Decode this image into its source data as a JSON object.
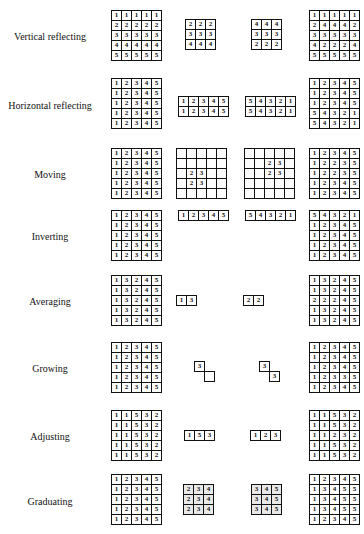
{
  "rows": [
    {
      "label": "Vertical reflecting",
      "top": 10,
      "label_top": 21,
      "grids": [
        {
          "left": 111,
          "top": 0,
          "cols": 5,
          "cells": [
            [
              1,
              1,
              1,
              1,
              1
            ],
            [
              2,
              2,
              2,
              2,
              2
            ],
            [
              3,
              3,
              3,
              3,
              3
            ],
            [
              4,
              4,
              4,
              4,
              4
            ],
            [
              5,
              5,
              5,
              5,
              5
            ]
          ]
        },
        {
          "left": 185,
          "top": 9,
          "cols": 3,
          "cells": [
            [
              2,
              2,
              2
            ],
            [
              3,
              3,
              3
            ],
            [
              4,
              4,
              4
            ]
          ]
        },
        {
          "left": 251,
          "top": 9,
          "cols": 3,
          "cells": [
            [
              4,
              4,
              4
            ],
            [
              3,
              3,
              3
            ],
            [
              2,
              2,
              2
            ]
          ]
        },
        {
          "left": 309,
          "top": 0,
          "cols": 5,
          "cells": [
            [
              1,
              1,
              1,
              1,
              1
            ],
            [
              2,
              4,
              4,
              4,
              2
            ],
            [
              3,
              3,
              3,
              3,
              3
            ],
            [
              4,
              2,
              2,
              2,
              4
            ],
            [
              5,
              5,
              5,
              5,
              5
            ]
          ]
        }
      ]
    },
    {
      "label": "Horizontal reflecting",
      "top": 78,
      "label_top": 22,
      "grids": [
        {
          "left": 111,
          "top": 0,
          "cols": 5,
          "cells": [
            [
              1,
              2,
              3,
              4,
              5
            ],
            [
              1,
              2,
              3,
              4,
              5
            ],
            [
              1,
              2,
              3,
              4,
              5
            ],
            [
              1,
              2,
              3,
              4,
              5
            ],
            [
              1,
              2,
              3,
              4,
              5
            ]
          ]
        },
        {
          "left": 178,
          "top": 18,
          "cols": 5,
          "cells": [
            [
              1,
              2,
              3,
              4,
              5
            ],
            [
              1,
              2,
              3,
              4,
              5
            ]
          ]
        },
        {
          "left": 245,
          "top": 18,
          "cols": 5,
          "cells": [
            [
              5,
              4,
              3,
              2,
              1
            ],
            [
              5,
              4,
              3,
              2,
              1
            ]
          ]
        },
        {
          "left": 309,
          "top": 0,
          "cols": 5,
          "cells": [
            [
              1,
              2,
              3,
              4,
              5
            ],
            [
              1,
              2,
              3,
              4,
              5
            ],
            [
              1,
              2,
              3,
              4,
              5
            ],
            [
              5,
              4,
              3,
              2,
              1
            ],
            [
              5,
              4,
              3,
              2,
              1
            ]
          ]
        }
      ]
    },
    {
      "label": "Moving",
      "top": 148,
      "label_top": 21,
      "grids": [
        {
          "left": 111,
          "top": 0,
          "cols": 5,
          "cells": [
            [
              1,
              2,
              3,
              4,
              5
            ],
            [
              1,
              2,
              3,
              4,
              5
            ],
            [
              1,
              2,
              3,
              4,
              5
            ],
            [
              1,
              2,
              3,
              4,
              5
            ],
            [
              1,
              2,
              3,
              4,
              5
            ]
          ]
        },
        {
          "left": 176,
          "top": 0,
          "cols": 5,
          "cells": [
            [
              "",
              "",
              "",
              "",
              ""
            ],
            [
              "",
              "",
              "",
              "",
              ""
            ],
            [
              "",
              2,
              3,
              "",
              ""
            ],
            [
              "",
              2,
              3,
              "",
              ""
            ],
            [
              "",
              "",
              "",
              "",
              ""
            ]
          ]
        },
        {
          "left": 244,
          "top": 0,
          "cols": 5,
          "cells": [
            [
              "",
              "",
              "",
              "",
              ""
            ],
            [
              "",
              "",
              2,
              3,
              ""
            ],
            [
              "",
              "",
              2,
              3,
              ""
            ],
            [
              "",
              "",
              "",
              "",
              ""
            ],
            [
              "",
              "",
              "",
              "",
              ""
            ]
          ]
        },
        {
          "left": 309,
          "top": 0,
          "cols": 5,
          "cells": [
            [
              1,
              2,
              3,
              4,
              5
            ],
            [
              1,
              2,
              2,
              3,
              5
            ],
            [
              1,
              2,
              2,
              3,
              5
            ],
            [
              1,
              2,
              3,
              4,
              5
            ],
            [
              1,
              2,
              3,
              4,
              5
            ]
          ]
        }
      ]
    },
    {
      "label": "Inverting",
      "top": 210,
      "label_top": 21,
      "grids": [
        {
          "left": 111,
          "top": 0,
          "cols": 5,
          "cells": [
            [
              1,
              2,
              3,
              4,
              5
            ],
            [
              1,
              2,
              3,
              4,
              5
            ],
            [
              1,
              2,
              3,
              4,
              5
            ],
            [
              1,
              2,
              3,
              4,
              5
            ],
            [
              1,
              2,
              3,
              4,
              5
            ]
          ]
        },
        {
          "left": 178,
          "top": 0,
          "cols": 5,
          "cells": [
            [
              1,
              2,
              3,
              4,
              5
            ]
          ]
        },
        {
          "left": 245,
          "top": 0,
          "cols": 5,
          "cells": [
            [
              5,
              4,
              3,
              2,
              1
            ]
          ]
        },
        {
          "left": 309,
          "top": 0,
          "cols": 5,
          "cells": [
            [
              5,
              4,
              3,
              2,
              1
            ],
            [
              1,
              2,
              3,
              4,
              5
            ],
            [
              1,
              2,
              3,
              4,
              5
            ],
            [
              1,
              2,
              3,
              4,
              5
            ],
            [
              1,
              2,
              3,
              4,
              5
            ]
          ]
        }
      ]
    },
    {
      "label": "Averaging",
      "top": 275,
      "label_top": 21,
      "grids": [
        {
          "left": 111,
          "top": 0,
          "cols": 5,
          "cells": [
            [
              1,
              3,
              2,
              4,
              5
            ],
            [
              1,
              3,
              2,
              4,
              5
            ],
            [
              1,
              3,
              2,
              4,
              5
            ],
            [
              1,
              3,
              2,
              4,
              5
            ],
            [
              1,
              3,
              2,
              4,
              5
            ]
          ]
        },
        {
          "left": 176,
          "top": 20,
          "cols": 2,
          "cells": [
            [
              1,
              3
            ]
          ]
        },
        {
          "left": 243,
          "top": 20,
          "cols": 2,
          "cells": [
            [
              2,
              2
            ]
          ]
        },
        {
          "left": 309,
          "top": 0,
          "cols": 5,
          "cells": [
            [
              1,
              3,
              2,
              4,
              5
            ],
            [
              1,
              3,
              2,
              4,
              5
            ],
            [
              2,
              2,
              2,
              4,
              5
            ],
            [
              1,
              3,
              2,
              4,
              5
            ],
            [
              1,
              3,
              2,
              4,
              5
            ]
          ]
        }
      ]
    },
    {
      "label": "Growing",
      "top": 342,
      "label_top": 21,
      "grids": [
        {
          "left": 111,
          "top": 0,
          "cols": 5,
          "cells": [
            [
              1,
              2,
              3,
              4,
              5
            ],
            [
              1,
              2,
              3,
              4,
              5
            ],
            [
              1,
              2,
              3,
              4,
              5
            ],
            [
              1,
              2,
              3,
              4,
              5
            ],
            [
              1,
              2,
              3,
              4,
              5
            ]
          ]
        },
        {
          "left": 309,
          "top": 0,
          "cols": 5,
          "cells": [
            [
              1,
              2,
              3,
              4,
              5
            ],
            [
              1,
              2,
              3,
              4,
              5
            ],
            [
              1,
              2,
              3,
              4,
              5
            ],
            [
              1,
              2,
              3,
              3,
              5
            ],
            [
              1,
              2,
              3,
              4,
              5
            ]
          ]
        }
      ],
      "shapes": [
        {
          "left": 194,
          "top": 19,
          "cells": [
            {
              "dx": 0,
              "dy": 0,
              "v": 3
            },
            {
              "dx": 10,
              "dy": 10,
              "v": ""
            }
          ]
        },
        {
          "left": 259,
          "top": 19,
          "cells": [
            {
              "dx": 0,
              "dy": 0,
              "v": 3
            },
            {
              "dx": 10,
              "dy": 10,
              "v": 3
            }
          ]
        }
      ]
    },
    {
      "label": "Adjusting",
      "top": 410,
      "label_top": 21,
      "grids": [
        {
          "left": 111,
          "top": 0,
          "cols": 5,
          "cells": [
            [
              1,
              1,
              5,
              3,
              2
            ],
            [
              1,
              1,
              5,
              3,
              2
            ],
            [
              1,
              1,
              5,
              3,
              2
            ],
            [
              1,
              1,
              5,
              3,
              2
            ],
            [
              1,
              1,
              5,
              3,
              2
            ]
          ]
        },
        {
          "left": 184,
          "top": 20,
          "cols": 3,
          "cells": [
            [
              1,
              5,
              3
            ]
          ]
        },
        {
          "left": 250,
          "top": 20,
          "cols": 3,
          "cells": [
            [
              1,
              2,
              3
            ]
          ]
        },
        {
          "left": 309,
          "top": 0,
          "cols": 5,
          "cells": [
            [
              1,
              1,
              5,
              3,
              2
            ],
            [
              1,
              1,
              5,
              3,
              2
            ],
            [
              1,
              1,
              2,
              3,
              2
            ],
            [
              1,
              1,
              5,
              3,
              2
            ],
            [
              1,
              1,
              5,
              3,
              2
            ]
          ]
        }
      ]
    },
    {
      "label": "Graduating",
      "top": 474,
      "label_top": 22,
      "grids": [
        {
          "left": 111,
          "top": 0,
          "cols": 5,
          "cells": [
            [
              1,
              2,
              3,
              4,
              5
            ],
            [
              1,
              2,
              3,
              4,
              5
            ],
            [
              1,
              2,
              3,
              4,
              5
            ],
            [
              1,
              2,
              3,
              4,
              5
            ],
            [
              1,
              2,
              3,
              4,
              5
            ]
          ]
        },
        {
          "left": 183,
          "top": 10,
          "cols": 3,
          "gray": true,
          "cells": [
            [
              2,
              3,
              4
            ],
            [
              2,
              3,
              4
            ],
            [
              2,
              3,
              4
            ]
          ]
        },
        {
          "left": 251,
          "top": 10,
          "cols": 3,
          "gray": true,
          "cells": [
            [
              3,
              4,
              5
            ],
            [
              3,
              4,
              5
            ],
            [
              3,
              4,
              5
            ]
          ]
        },
        {
          "left": 309,
          "top": 0,
          "cols": 5,
          "cells": [
            [
              1,
              2,
              3,
              4,
              5
            ],
            [
              1,
              3,
              4,
              5,
              5
            ],
            [
              1,
              3,
              4,
              5,
              5
            ],
            [
              1,
              3,
              4,
              5,
              5
            ],
            [
              1,
              2,
              3,
              4,
              5
            ]
          ]
        }
      ]
    }
  ]
}
